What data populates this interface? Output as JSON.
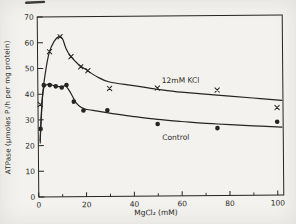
{
  "figure": {
    "kind": "scanned-journal-figure",
    "paper_color": "#f3f2ee",
    "ink_color": "#242422",
    "scan_artifact": "dark-smudge-top-left"
  },
  "chart_data": {
    "type": "line",
    "title": "",
    "xlabel": "MgCl₂ (mM)",
    "ylabel": "ATPase (μmoles  Pᵢ/h  per  mg  protein)",
    "xlim": [
      0,
      102.5
    ],
    "ylim": [
      0,
      70
    ],
    "x_major_ticks": [
      0,
      20,
      40,
      60,
      80,
      100
    ],
    "x_minor_ticks": [
      10,
      30,
      50,
      70,
      90
    ],
    "y_major_ticks": [
      0,
      10,
      20,
      30,
      40,
      50,
      60,
      70
    ],
    "grid": false,
    "frame": "full-box",
    "legend_position": "inline-curve-labels",
    "series": [
      {
        "name": "12mM KCl",
        "marker": "x",
        "label_anchor": {
          "x": 52,
          "y": 44
        },
        "points": [
          [
            1,
            36
          ],
          [
            5,
            56.5
          ],
          [
            9.5,
            62.3
          ],
          [
            14,
            54.5
          ],
          [
            18,
            50.5
          ],
          [
            21,
            49
          ],
          [
            30,
            42
          ],
          [
            50,
            42
          ],
          [
            75,
            41
          ],
          [
            100,
            34
          ]
        ],
        "trend": [
          [
            0.8,
            22
          ],
          [
            2,
            40
          ],
          [
            3.5,
            50
          ],
          [
            5,
            56.5
          ],
          [
            7,
            60.5
          ],
          [
            9,
            62.3
          ],
          [
            10.5,
            61.5
          ],
          [
            12,
            57.5
          ],
          [
            14,
            54.5
          ],
          [
            17,
            51.5
          ],
          [
            20,
            49.5
          ],
          [
            25,
            46.5
          ],
          [
            30,
            44.5
          ],
          [
            40,
            43
          ],
          [
            50,
            41.5
          ],
          [
            60,
            40.3
          ],
          [
            75,
            39
          ],
          [
            90,
            37.8
          ],
          [
            102,
            36.8
          ]
        ]
      },
      {
        "name": "Control",
        "marker": "dot",
        "label_anchor": {
          "x": 52,
          "y": 22
        },
        "points": [
          [
            1,
            26.5
          ],
          [
            2.5,
            43.5
          ],
          [
            5,
            43.5
          ],
          [
            7.5,
            43
          ],
          [
            10,
            42.5
          ],
          [
            12,
            43.5
          ],
          [
            15,
            37
          ],
          [
            19,
            33.5
          ],
          [
            29,
            33.5
          ],
          [
            50,
            28
          ],
          [
            75,
            26.2
          ],
          [
            100,
            28.5
          ]
        ],
        "trend": [
          [
            0.8,
            21
          ],
          [
            1,
            26.5
          ],
          [
            1.8,
            38
          ],
          [
            2.5,
            42.5
          ],
          [
            4,
            43.8
          ],
          [
            6,
            43.5
          ],
          [
            8,
            43
          ],
          [
            10,
            42.8
          ],
          [
            11.5,
            43.2
          ],
          [
            13,
            41.5
          ],
          [
            14.5,
            39
          ],
          [
            16,
            36.5
          ],
          [
            18,
            34.8
          ],
          [
            20,
            34
          ],
          [
            25,
            33.2
          ],
          [
            30,
            32.4
          ],
          [
            40,
            31
          ],
          [
            50,
            29.8
          ],
          [
            60,
            28.9
          ],
          [
            75,
            27.8
          ],
          [
            90,
            27
          ],
          [
            102,
            26.4
          ]
        ]
      }
    ]
  }
}
